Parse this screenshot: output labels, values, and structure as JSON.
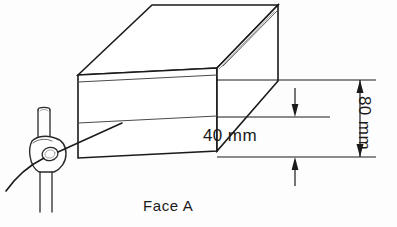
{
  "drawing": {
    "title_label": "Face A",
    "dimensions": [
      {
        "id": "height-lower-band",
        "label": "40 mm",
        "value": 40,
        "unit": "mm",
        "orientation": "vertical",
        "arrow_style": "outside"
      },
      {
        "id": "height-total",
        "label": "80 mm",
        "value": 80,
        "unit": "mm",
        "orientation": "vertical",
        "arrow_style": "inside",
        "text_rotation_deg": 90
      }
    ],
    "colors": {
      "line": "#1a1a1a",
      "thin_line": "#4a4a4a",
      "background": "#fdfdfd",
      "text": "#1a1a1a"
    },
    "objects": [
      {
        "id": "workpiece",
        "name": "rectangular-block",
        "faces": [
          "top",
          "front",
          "right"
        ],
        "scribed_lines": 2
      },
      {
        "id": "surface-gauge",
        "name": "scriber-surface-gauge",
        "parts": [
          "vertical-post",
          "clamp-block",
          "scriber-needle"
        ]
      }
    ]
  },
  "labels": {
    "dim_40": "40 mm",
    "dim_80": "80 mm",
    "face_a": "Face A"
  }
}
